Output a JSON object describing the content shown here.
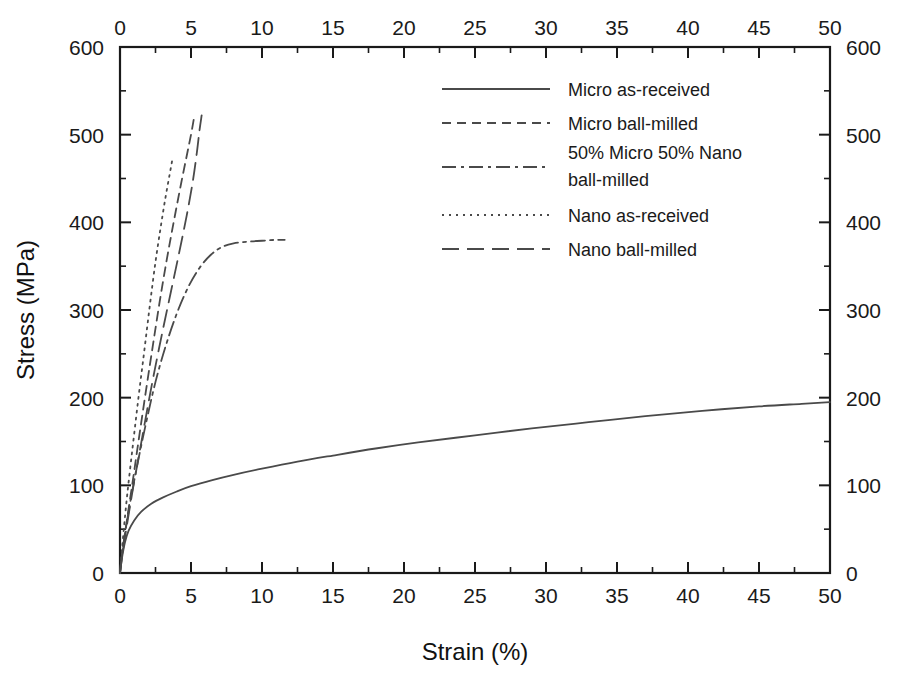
{
  "chart_data": {
    "type": "line",
    "title": "",
    "xlabel": "Strain (%)",
    "ylabel": "Stress (MPa)",
    "xlim": [
      0,
      50
    ],
    "ylim": [
      0,
      600
    ],
    "xticks": [
      0,
      5,
      10,
      15,
      20,
      25,
      30,
      35,
      40,
      45,
      50
    ],
    "yticks": [
      0,
      100,
      200,
      300,
      400,
      500,
      600
    ],
    "x_minor_step": 2.5,
    "y_minor_step": 50,
    "grid": false,
    "top_axis_mirrored": true,
    "right_axis_mirrored": true,
    "legend_position": "upper-right-inside",
    "series": [
      {
        "name": "Micro as-received",
        "dash": "none",
        "points": [
          [
            0,
            0
          ],
          [
            0.15,
            18
          ],
          [
            0.35,
            35
          ],
          [
            0.6,
            48
          ],
          [
            1.0,
            60
          ],
          [
            1.5,
            70
          ],
          [
            2.2,
            79
          ],
          [
            3.0,
            86
          ],
          [
            4.0,
            93
          ],
          [
            5.0,
            99
          ],
          [
            6.5,
            106
          ],
          [
            8.0,
            112
          ],
          [
            10.0,
            119
          ],
          [
            12.5,
            127
          ],
          [
            15.0,
            134
          ],
          [
            18.0,
            142
          ],
          [
            21.0,
            149
          ],
          [
            25.0,
            157
          ],
          [
            29.0,
            165
          ],
          [
            33.0,
            172
          ],
          [
            37.0,
            179
          ],
          [
            41.0,
            185
          ],
          [
            45.0,
            190
          ],
          [
            48.0,
            193
          ],
          [
            50.0,
            195
          ]
        ],
        "end_point": [
          50.0,
          195
        ]
      },
      {
        "name": "Micro ball-milled",
        "dash": "dashed",
        "points": [
          [
            0,
            0
          ],
          [
            0.2,
            28
          ],
          [
            0.5,
            62
          ],
          [
            0.9,
            105
          ],
          [
            1.3,
            150
          ],
          [
            1.8,
            205
          ],
          [
            2.3,
            258
          ],
          [
            2.8,
            310
          ],
          [
            3.3,
            358
          ],
          [
            3.8,
            402
          ],
          [
            4.3,
            444
          ],
          [
            4.7,
            476
          ],
          [
            5.0,
            500
          ],
          [
            5.2,
            518
          ]
        ],
        "end_point": [
          5.2,
          518
        ]
      },
      {
        "name": "50% Micro 50% Nano ball-milled",
        "dash": "dash-dot",
        "points": [
          [
            0,
            0
          ],
          [
            0.15,
            22
          ],
          [
            0.4,
            50
          ],
          [
            0.8,
            88
          ],
          [
            1.3,
            130
          ],
          [
            1.9,
            176
          ],
          [
            2.5,
            218
          ],
          [
            3.2,
            258
          ],
          [
            4.0,
            296
          ],
          [
            4.8,
            326
          ],
          [
            5.6,
            348
          ],
          [
            6.4,
            363
          ],
          [
            7.2,
            372
          ],
          [
            8.0,
            376
          ],
          [
            9.0,
            378
          ],
          [
            10.0,
            379
          ],
          [
            11.0,
            380
          ],
          [
            11.6,
            380
          ]
        ],
        "end_point": [
          11.6,
          380
        ]
      },
      {
        "name": "Nano as-received",
        "dash": "dotted",
        "points": [
          [
            0,
            0
          ],
          [
            0.2,
            38
          ],
          [
            0.5,
            88
          ],
          [
            0.9,
            145
          ],
          [
            1.3,
            200
          ],
          [
            1.7,
            252
          ],
          [
            2.1,
            305
          ],
          [
            2.5,
            355
          ],
          [
            2.9,
            398
          ],
          [
            3.2,
            428
          ],
          [
            3.5,
            455
          ],
          [
            3.7,
            473
          ]
        ],
        "end_point": [
          3.7,
          473
        ]
      },
      {
        "name": "Nano ball-milled",
        "dash": "long-dash",
        "points": [
          [
            0,
            0
          ],
          [
            0.2,
            25
          ],
          [
            0.5,
            56
          ],
          [
            0.9,
            95
          ],
          [
            1.4,
            140
          ],
          [
            1.9,
            185
          ],
          [
            2.4,
            228
          ],
          [
            3.0,
            276
          ],
          [
            3.6,
            322
          ],
          [
            4.2,
            368
          ],
          [
            4.7,
            408
          ],
          [
            5.1,
            444
          ],
          [
            5.4,
            478
          ],
          [
            5.6,
            505
          ],
          [
            5.75,
            522
          ]
        ],
        "end_point": [
          5.75,
          522
        ]
      }
    ]
  },
  "axes": {
    "x_bottom_label": "Strain (%)",
    "y_left_label": "Stress (MPa)",
    "x_ticks": [
      "0",
      "5",
      "10",
      "15",
      "20",
      "25",
      "30",
      "35",
      "40",
      "45",
      "50"
    ],
    "y_ticks": [
      "0",
      "100",
      "200",
      "300",
      "400",
      "500",
      "600"
    ]
  },
  "legend": {
    "entries": [
      {
        "label": "Micro as-received",
        "style": "solid"
      },
      {
        "label": "Micro ball-milled",
        "style": "dashed"
      },
      {
        "label": "50% Micro 50% Nano",
        "label2": "ball-milled",
        "style": "dash-dot"
      },
      {
        "label": "Nano as-received",
        "style": "dotted"
      },
      {
        "label": "Nano ball-milled",
        "style": "long-dash"
      }
    ]
  },
  "colors": {
    "line": "#4a4a4a",
    "axis": "#1a1a1a",
    "background": "#ffffff"
  }
}
